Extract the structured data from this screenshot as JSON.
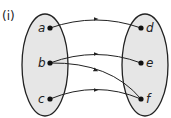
{
  "figure_label": "(i)",
  "domain_set": {
    "elements": [
      "a",
      "b",
      "c"
    ]
  },
  "codomain_set": {
    "elements": [
      "d",
      "e",
      "f"
    ]
  },
  "mappings": [
    {
      "from": "a",
      "to": "d"
    },
    {
      "from": "b",
      "to": "e"
    },
    {
      "from": "b",
      "to": "f"
    },
    {
      "from": "c",
      "to": "f"
    }
  ],
  "colors": {
    "set_fill": "#e6e6e6",
    "stroke": "#222222"
  }
}
